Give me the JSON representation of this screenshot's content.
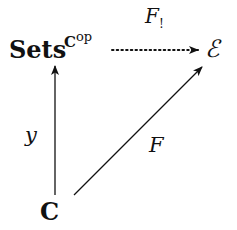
{
  "diagram": {
    "type": "commutative-diagram",
    "nodes": {
      "presheaf": {
        "base": "Sets",
        "superscript_base": "C",
        "superscript_op": "op"
      },
      "topos": {
        "label": "ℰ"
      },
      "category": {
        "label": "C"
      }
    },
    "arrows": {
      "yoneda": {
        "from": "C",
        "to": "Sets^{C^op}",
        "label": "y",
        "style": "solid"
      },
      "left_kan": {
        "from": "Sets^{C^op}",
        "to": "ℰ",
        "label_main": "F",
        "label_sub": "!",
        "style": "dotted"
      },
      "functor": {
        "from": "C",
        "to": "ℰ",
        "label": "F",
        "style": "solid"
      }
    }
  },
  "colors": {
    "ink": "#111111",
    "background": "#ffffff"
  }
}
